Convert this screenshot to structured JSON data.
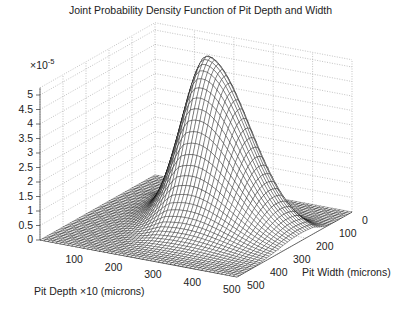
{
  "chart_data": {
    "type": "surface",
    "title": "Joint Probability Density Function of Pit Depth and Width",
    "xlabel": "Pit Depth ×10 (microns)",
    "ylabel": "Pit Width (microns)",
    "zlabel": "",
    "z_multiplier": "×10",
    "z_exponent": "-5",
    "x_ticks": [
      100,
      200,
      300,
      400,
      500
    ],
    "y_ticks": [
      0,
      100,
      200,
      300,
      400,
      500
    ],
    "z_ticks": [
      "0",
      "0.5",
      "1",
      "1.5",
      "2",
      "2.5",
      "3",
      "3.5",
      "4",
      "4.5",
      "5"
    ],
    "xlim": [
      0,
      500
    ],
    "ylim": [
      0,
      500
    ],
    "zlim": [
      0,
      5.25
    ],
    "grid": true,
    "mesh_color": "#000000",
    "surface_fill": "#ffffff",
    "peak": {
      "pit_depth": 230,
      "pit_width": 165,
      "density_e5": 5.45
    },
    "shape": "skewed unimodal bell surface; sharp rise on low-width side, long tail toward larger pit depth and width; near zero elsewhere"
  },
  "labels": {
    "title": "Joint Probability Density Function of Pit Depth and Width",
    "xlabel": "Pit Depth ×10 (microns)",
    "ylabel": "Pit Width (microns)",
    "z_multiplier_base": "×10",
    "z_multiplier_exp": "-5"
  }
}
